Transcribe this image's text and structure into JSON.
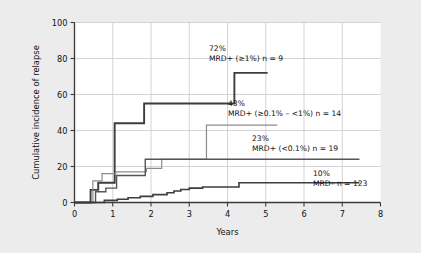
{
  "figure": {
    "background_color": "#ececed",
    "plot_background_color": "#ffffff",
    "grid_color": "#c9c9cc",
    "axis_color": "#3a3a3a"
  },
  "chart_data": {
    "type": "line",
    "subtype": "step-kaplan-meier-cumulative-incidence",
    "title": "",
    "xlabel": "Years",
    "ylabel": "Cumulative incidence of relapse",
    "xlim": [
      0,
      8
    ],
    "ylim": [
      0,
      100
    ],
    "xticks": [
      0,
      1,
      2,
      3,
      4,
      5,
      6,
      7,
      8
    ],
    "xtick_labels": [
      "0",
      "1",
      "2",
      "3",
      "4",
      "5",
      "6",
      "7",
      "8"
    ],
    "yticks": [
      0,
      20,
      40,
      60,
      80,
      100
    ],
    "ytick_labels": [
      "0",
      "20",
      "40",
      "60",
      "80",
      "100"
    ],
    "grid": true,
    "grid_axes": "both",
    "legend": "inline-annotations",
    "series": [
      {
        "name": "MRD+ (≥1%) n = 9",
        "final_value_label": "72%",
        "final_value": 72,
        "n": 9,
        "color": "#3d3d3d",
        "line_width": 1.9,
        "x": [
          0.0,
          0.42,
          0.42,
          0.62,
          0.62,
          1.05,
          1.05,
          1.82,
          1.82,
          4.18,
          4.18,
          5.05
        ],
        "y": [
          0,
          0,
          7,
          7,
          11,
          11,
          44,
          44,
          55,
          55,
          72,
          72
        ]
      },
      {
        "name": "MRD+ (≥0.1% – <1%) n = 14",
        "final_value_label": "43%",
        "final_value": 43,
        "n": 14,
        "color": "#8c8c8e",
        "line_width": 1.2,
        "x": [
          0.0,
          0.48,
          0.48,
          0.72,
          0.72,
          1.08,
          1.08,
          1.88,
          1.88,
          2.28,
          2.28,
          3.45,
          3.45,
          5.3
        ],
        "y": [
          0,
          0,
          12,
          12,
          16,
          16,
          17,
          17,
          19,
          19,
          24,
          24,
          43,
          43
        ]
      },
      {
        "name": "MRD+ (<0.1%) n = 19",
        "final_value_label": "23%",
        "final_value": 23,
        "n": 19,
        "color": "#555557",
        "line_width": 1.4,
        "x": [
          0.0,
          0.55,
          0.55,
          0.82,
          0.82,
          1.1,
          1.1,
          1.85,
          1.85,
          7.45
        ],
        "y": [
          0,
          0,
          6,
          6,
          8,
          8,
          15,
          15,
          24,
          24
        ]
      },
      {
        "name": "MRD–  n = 123",
        "final_value_label": "10%",
        "final_value": 10,
        "n": 123,
        "color": "#3d3d3d",
        "line_width": 1.6,
        "x": [
          0.0,
          0.78,
          0.78,
          1.12,
          1.12,
          1.4,
          1.4,
          1.72,
          1.72,
          2.05,
          2.05,
          2.42,
          2.42,
          2.6,
          2.6,
          2.78,
          2.78,
          3.0,
          3.0,
          3.35,
          3.35,
          4.3,
          4.3,
          7.45
        ],
        "y": [
          0,
          0,
          1.2,
          1.2,
          1.8,
          1.8,
          2.6,
          2.6,
          3.4,
          3.4,
          4.4,
          4.4,
          5.4,
          5.4,
          6.4,
          6.4,
          7.2,
          7.2,
          8.0,
          8.0,
          8.6,
          8.6,
          11,
          11
        ]
      }
    ],
    "annotations": [
      {
        "pct": "72%",
        "label": "MRD+ (≥1%) n = 9",
        "x_px": 209,
        "y_px": 51
      },
      {
        "pct": "43%",
        "label": "MRD+ (≥0.1% – <1%) n = 14",
        "x_px": 228,
        "y_px": 106
      },
      {
        "pct": "23%",
        "label": "MRD+ (<0.1%) n = 19",
        "x_px": 252,
        "y_px": 141
      },
      {
        "pct": "10%",
        "label": "MRD–  n = 123",
        "x_px": 313,
        "y_px": 176
      }
    ]
  }
}
